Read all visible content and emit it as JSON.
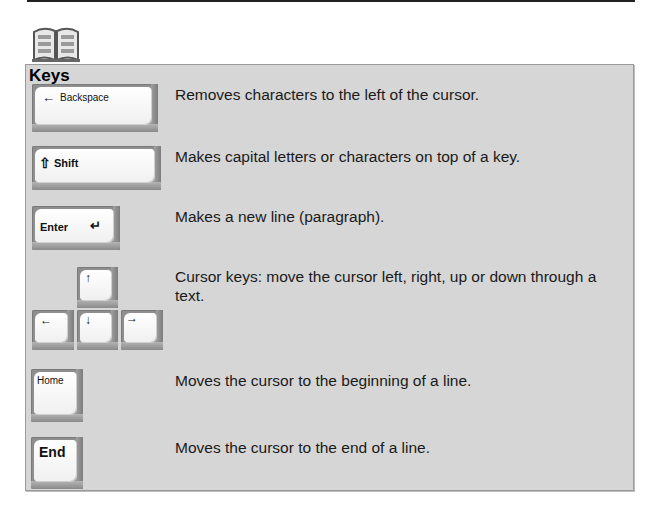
{
  "section": {
    "title": "Keys",
    "icon": "book-icon"
  },
  "keys": [
    {
      "name": "backspace",
      "label": "Backspace",
      "glyph": "←",
      "description": "Removes characters to the left of the cursor."
    },
    {
      "name": "shift",
      "label": "Shift",
      "glyph": "⇧",
      "description": "Makes capital letters or characters on top of a key."
    },
    {
      "name": "enter",
      "label": "Enter",
      "glyph": "↵",
      "description": "Makes a new line (paragraph)."
    },
    {
      "name": "cursor",
      "glyphs": {
        "up": "↑",
        "down": "↓",
        "left": "←",
        "right": "→"
      },
      "description": "Cursor keys: move the cursor left, right, up or down through a text."
    },
    {
      "name": "home",
      "label": "Home",
      "description": "Moves the cursor to the beginning of a line."
    },
    {
      "name": "end",
      "label": "End",
      "description": "Moves the cursor to the end of a line."
    }
  ],
  "colors": {
    "panel_bg": "#d6d6d6",
    "panel_border": "#9a9a9a",
    "key_face": "#ffffff",
    "key_shadow": "#8e8e8e"
  }
}
